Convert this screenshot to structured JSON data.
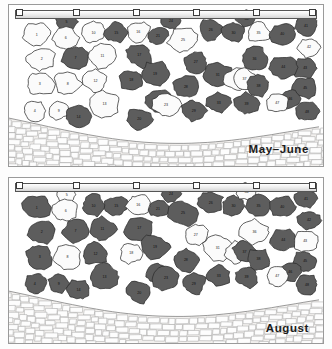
{
  "figure": {
    "panel_count": 2
  },
  "colors": {
    "light_cell": "#fbfbfb",
    "dark_cell": "#5d5d5d",
    "outline": "#2b2b2b",
    "cobble_fill": "#fdfdfd",
    "cobble_outline": "#8c8c8c",
    "substrate": "#f2f0ee",
    "frame": "#9a9a9a",
    "label_text": "#1b1b1b"
  },
  "scale_bar": {
    "name": "scale-bar",
    "tick_count": 6,
    "tick_positions_pct": [
      0,
      20,
      40,
      60,
      80,
      100
    ]
  },
  "panels": [
    {
      "id": "may-june",
      "caption": "May–June",
      "shaded_cells": [
        5,
        7,
        14,
        15,
        17,
        18,
        19,
        20,
        21,
        22,
        24,
        26,
        27,
        28,
        29,
        30,
        31,
        33,
        34,
        36,
        38,
        39,
        40,
        41,
        43,
        44,
        45,
        46,
        48
      ],
      "light_cells": [
        1,
        2,
        3,
        4,
        6,
        8,
        9,
        10,
        11,
        12,
        13,
        16,
        23,
        25,
        32,
        35,
        37,
        42,
        47
      ]
    },
    {
      "id": "august",
      "caption": "August",
      "shaded_cells": [
        1,
        2,
        3,
        4,
        7,
        9,
        10,
        11,
        12,
        13,
        14,
        15,
        17,
        19,
        20,
        21,
        22,
        23,
        24,
        25,
        26,
        28,
        29,
        30,
        33,
        35,
        37,
        38,
        39,
        40,
        41,
        42,
        44,
        45,
        46,
        48
      ],
      "light_cells": [
        5,
        6,
        8,
        16,
        18,
        27,
        31,
        32,
        34,
        36,
        43,
        47
      ]
    }
  ],
  "cells": [
    {
      "n": 1,
      "cx": 28,
      "cy": 30,
      "r": 13.5,
      "seed": 11
    },
    {
      "n": 2,
      "cx": 33,
      "cy": 55,
      "r": 13.5,
      "seed": 23
    },
    {
      "n": 3,
      "cx": 31,
      "cy": 80,
      "r": 13.5,
      "seed": 37
    },
    {
      "n": 4,
      "cx": 26,
      "cy": 107,
      "r": 11.0,
      "seed": 41
    },
    {
      "n": 5,
      "cx": 58,
      "cy": 17,
      "r": 10.0,
      "seed": 53
    },
    {
      "n": 6,
      "cx": 57,
      "cy": 33,
      "r": 12.5,
      "seed": 67
    },
    {
      "n": 7,
      "cx": 67,
      "cy": 54,
      "r": 13.0,
      "seed": 71
    },
    {
      "n": 8,
      "cx": 59,
      "cy": 80,
      "r": 13.0,
      "seed": 83
    },
    {
      "n": 9,
      "cx": 50,
      "cy": 107,
      "r": 10.0,
      "seed": 97
    },
    {
      "n": 10,
      "cx": 85,
      "cy": 28,
      "r": 12.0,
      "seed": 101
    },
    {
      "n": 11,
      "cx": 94,
      "cy": 52,
      "r": 13.5,
      "seed": 103
    },
    {
      "n": 12,
      "cx": 87,
      "cy": 77,
      "r": 12.5,
      "seed": 107
    },
    {
      "n": 13,
      "cx": 96,
      "cy": 100,
      "r": 14.0,
      "seed": 109
    },
    {
      "n": 14,
      "cx": 70,
      "cy": 113,
      "r": 11.5,
      "seed": 113
    },
    {
      "n": 15,
      "cx": 108,
      "cy": 28,
      "r": 11.0,
      "seed": 127
    },
    {
      "n": 16,
      "cx": 130,
      "cy": 27,
      "r": 11.5,
      "seed": 131
    },
    {
      "n": 17,
      "cx": 131,
      "cy": 51,
      "r": 13.5,
      "seed": 137
    },
    {
      "n": 18,
      "cx": 123,
      "cy": 76,
      "r": 11.5,
      "seed": 139
    },
    {
      "n": 19,
      "cx": 147,
      "cy": 70,
      "r": 14.0,
      "seed": 149
    },
    {
      "n": 20,
      "cx": 131,
      "cy": 116,
      "r": 12.5,
      "seed": 151
    },
    {
      "n": 21,
      "cx": 150,
      "cy": 31,
      "r": 10.0,
      "seed": 157
    },
    {
      "n": 22,
      "cx": 150,
      "cy": 97,
      "r": 12.5,
      "seed": 163
    },
    {
      "n": 23,
      "cx": 158,
      "cy": 101,
      "r": 13.5,
      "seed": 167
    },
    {
      "n": 24,
      "cx": 163,
      "cy": 16,
      "r": 9.0,
      "seed": 173
    },
    {
      "n": 25,
      "cx": 175,
      "cy": 36,
      "r": 14.0,
      "seed": 179
    },
    {
      "n": 26,
      "cx": 203,
      "cy": 25,
      "r": 12.0,
      "seed": 181
    },
    {
      "n": 27,
      "cx": 188,
      "cy": 58,
      "r": 12.0,
      "seed": 191
    },
    {
      "n": 28,
      "cx": 178,
      "cy": 83,
      "r": 13.0,
      "seed": 193
    },
    {
      "n": 29,
      "cx": 186,
      "cy": 107,
      "r": 12.0,
      "seed": 197
    },
    {
      "n": 30,
      "cx": 226,
      "cy": 28,
      "r": 11.5,
      "seed": 199
    },
    {
      "n": 31,
      "cx": 210,
      "cy": 71,
      "r": 14.0,
      "seed": 211
    },
    {
      "n": 32,
      "cx": 229,
      "cy": 75,
      "r": 12.0,
      "seed": 223
    },
    {
      "n": 33,
      "cx": 211,
      "cy": 99,
      "r": 11.5,
      "seed": 227
    },
    {
      "n": 34,
      "cx": 239,
      "cy": 14,
      "r": 9.5,
      "seed": 229
    },
    {
      "n": 35,
      "cx": 251,
      "cy": 28,
      "r": 11.5,
      "seed": 233
    },
    {
      "n": 36,
      "cx": 247,
      "cy": 55,
      "r": 13.5,
      "seed": 239
    },
    {
      "n": 37,
      "cx": 237,
      "cy": 75,
      "r": 11.5,
      "seed": 241
    },
    {
      "n": 38,
      "cx": 251,
      "cy": 82,
      "r": 11.5,
      "seed": 251
    },
    {
      "n": 39,
      "cx": 239,
      "cy": 100,
      "r": 12.0,
      "seed": 257
    },
    {
      "n": 40,
      "cx": 275,
      "cy": 29,
      "r": 12.5,
      "seed": 263
    },
    {
      "n": 41,
      "cx": 299,
      "cy": 21,
      "r": 11.0,
      "seed": 269
    },
    {
      "n": 42,
      "cx": 302,
      "cy": 43,
      "r": 11.0,
      "seed": 271
    },
    {
      "n": 43,
      "cx": 298,
      "cy": 64,
      "r": 12.0,
      "seed": 277
    },
    {
      "n": 44,
      "cx": 276,
      "cy": 63,
      "r": 12.5,
      "seed": 281
    },
    {
      "n": 45,
      "cx": 298,
      "cy": 84,
      "r": 11.5,
      "seed": 283
    },
    {
      "n": 46,
      "cx": 283,
      "cy": 95,
      "r": 10.5,
      "seed": 293
    },
    {
      "n": 47,
      "cx": 270,
      "cy": 99,
      "r": 10.5,
      "seed": 307
    },
    {
      "n": 48,
      "cx": 300,
      "cy": 108,
      "r": 11.0,
      "seed": 311
    }
  ],
  "boundary": {
    "name": "cobble-boundary",
    "description": "wavy boundary separating mosaic cells from cobble band"
  }
}
